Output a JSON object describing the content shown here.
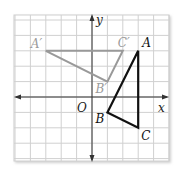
{
  "diagram": {
    "type": "coordinate-plane-transformation",
    "grid": {
      "x_min": -5,
      "x_max": 5,
      "y_min": -4,
      "y_max": 5,
      "origin_px": [
        92,
        97
      ],
      "unit_px": 15.4,
      "line_color": "#d0d0d0",
      "background": "#ffffff"
    },
    "axes": {
      "x_label": "x",
      "y_label": "y",
      "origin_label": "O",
      "color": "#333333"
    },
    "triangles": [
      {
        "name": "ABC",
        "role": "original",
        "color": "#111111",
        "vertices": [
          {
            "label": "A",
            "x": 3,
            "y": 3
          },
          {
            "label": "B",
            "x": 1,
            "y": -1
          },
          {
            "label": "C",
            "x": 3,
            "y": -2
          }
        ]
      },
      {
        "name": "A'B'C'",
        "role": "image",
        "color": "#999999",
        "vertices": [
          {
            "label": "A′",
            "x": -3,
            "y": 3
          },
          {
            "label": "B′",
            "x": 1,
            "y": 1
          },
          {
            "label": "C′",
            "x": 2,
            "y": 3
          }
        ]
      }
    ]
  }
}
